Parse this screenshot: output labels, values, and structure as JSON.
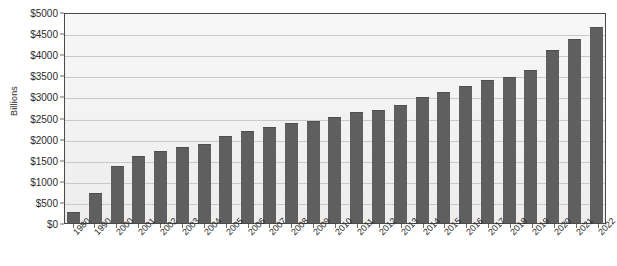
{
  "chart_data": {
    "type": "bar",
    "title": "",
    "subtitle": "",
    "xlabel": "",
    "ylabel": "Billions",
    "ylim": [
      0,
      5000
    ],
    "ytick_labels": [
      "$5000",
      "$4500",
      "$4000",
      "$3500",
      "$3000",
      "$2500",
      "$2000",
      "$1500",
      "$1000",
      "$500",
      "$0"
    ],
    "ytick_values": [
      5000,
      4500,
      4000,
      3500,
      3000,
      2500,
      2000,
      1500,
      1000,
      500,
      0
    ],
    "grid": true,
    "legend": false,
    "bar_color": "#5f5f5f",
    "plot_background": "#f2f2f2",
    "categories": [
      "1980",
      "1990",
      "2000",
      "2001",
      "2002",
      "2003",
      "2004",
      "2005",
      "2006",
      "2007",
      "2008",
      "2009",
      "2010",
      "2011",
      "2012",
      "2013",
      "2014",
      "2015",
      "2016",
      "2017",
      "2018",
      "2019",
      "2020",
      "2021",
      "2022"
    ],
    "values": [
      250,
      700,
      1350,
      1580,
      1700,
      1800,
      1880,
      2060,
      2180,
      2280,
      2380,
      2420,
      2520,
      2620,
      2680,
      2800,
      2980,
      3100,
      3250,
      3400,
      3450,
      3620,
      4100,
      4350,
      4650
    ]
  }
}
